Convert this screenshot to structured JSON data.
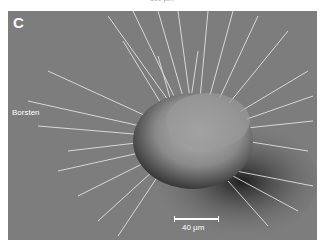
{
  "figure": {
    "top_caption": "100 µm",
    "panel": {
      "letter": "C",
      "annotation": "Borsten",
      "scale_bar_label": "40 µm",
      "background_color": "#7d7d7d"
    }
  }
}
